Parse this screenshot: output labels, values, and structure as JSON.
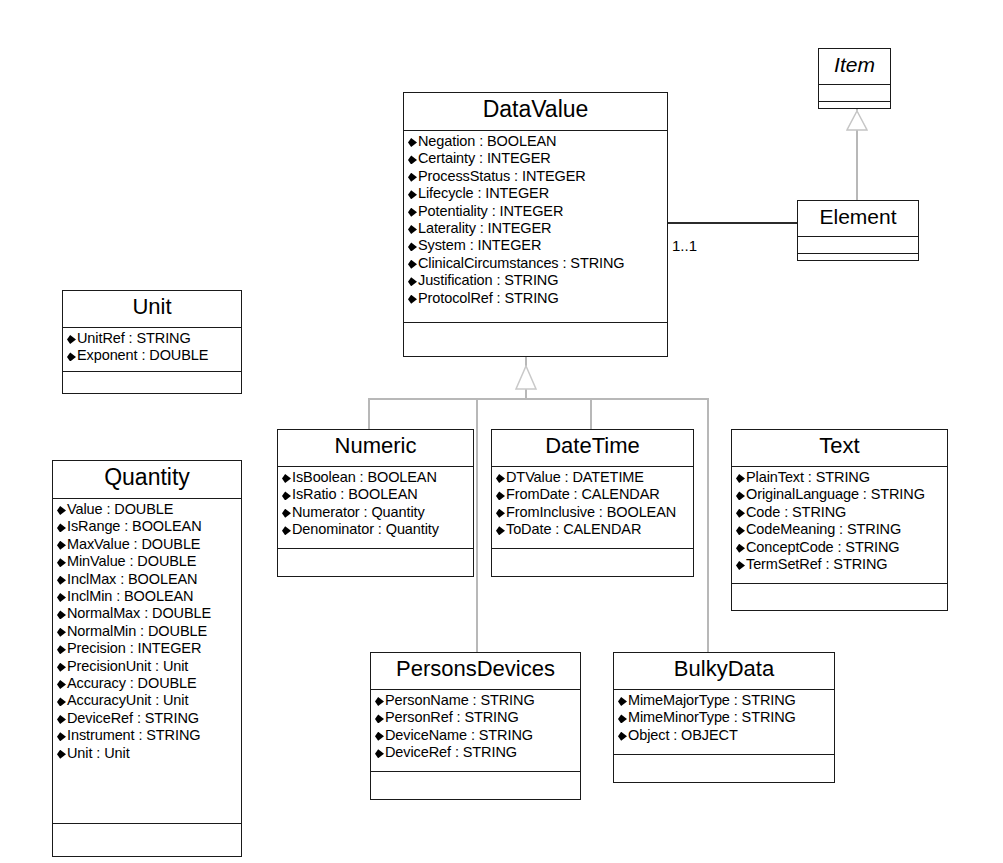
{
  "diagram": {
    "type": "uml-class-diagram",
    "background": "#ffffff",
    "line_color": "#6e6e6e",
    "border_color": "#1a1a1a"
  },
  "classes": {
    "item": {
      "name": "Item",
      "abstract": true,
      "attributes": [],
      "operations": []
    },
    "element": {
      "name": "Element",
      "abstract": false,
      "attributes": [],
      "operations": []
    },
    "datavalue": {
      "name": "DataValue",
      "abstract": false,
      "attributes": [
        "Negation : BOOLEAN",
        "Certainty : INTEGER",
        "ProcessStatus : INTEGER",
        "Lifecycle : INTEGER",
        "Potentiality : INTEGER",
        "Laterality : INTEGER",
        "System : INTEGER",
        "ClinicalCircumstances : STRING",
        "Justification : STRING",
        "ProtocolRef : STRING"
      ],
      "operations": []
    },
    "unit": {
      "name": "Unit",
      "abstract": false,
      "attributes": [
        "UnitRef : STRING",
        "Exponent : DOUBLE"
      ],
      "operations": []
    },
    "quantity": {
      "name": "Quantity",
      "abstract": false,
      "attributes": [
        "Value : DOUBLE",
        "IsRange : BOOLEAN",
        "MaxValue : DOUBLE",
        "MinValue : DOUBLE",
        "InclMax : BOOLEAN",
        "InclMin : BOOLEAN",
        "NormalMax : DOUBLE",
        "NormalMin : DOUBLE",
        "Precision : INTEGER",
        "PrecisionUnit : Unit",
        "Accuracy : DOUBLE",
        "AccuracyUnit : Unit",
        "DeviceRef : STRING",
        "Instrument : STRING",
        "Unit : Unit"
      ],
      "operations": []
    },
    "numeric": {
      "name": "Numeric",
      "abstract": false,
      "attributes": [
        "IsBoolean : BOOLEAN",
        "IsRatio : BOOLEAN",
        "Numerator : Quantity",
        "Denominator : Quantity"
      ],
      "operations": []
    },
    "datetime": {
      "name": "DateTime",
      "abstract": false,
      "attributes": [
        "DTValue : DATETIME",
        "FromDate : CALENDAR",
        "FromInclusive : BOOLEAN",
        "ToDate : CALENDAR"
      ],
      "operations": []
    },
    "text": {
      "name": "Text",
      "abstract": false,
      "attributes": [
        "PlainText : STRING",
        "OriginalLanguage : STRING",
        "Code : STRING",
        "CodeMeaning : STRING",
        "ConceptCode : STRING",
        "TermSetRef : STRING"
      ],
      "operations": []
    },
    "personsdevices": {
      "name": "PersonsDevices",
      "abstract": false,
      "attributes": [
        "PersonName : STRING",
        "PersonRef : STRING",
        "DeviceName : STRING",
        "DeviceRef : STRING"
      ],
      "operations": []
    },
    "bulkydata": {
      "name": "BulkyData",
      "abstract": false,
      "attributes": [
        "MimeMajorType : STRING",
        "MimeMinorType : STRING",
        "Object : OBJECT"
      ],
      "operations": []
    }
  },
  "relationships": {
    "element_to_item": {
      "kind": "generalization",
      "from": "Element",
      "to": "Item",
      "label": ""
    },
    "datavalue_to_element": {
      "kind": "association",
      "from": "DataValue",
      "to": "Element",
      "label": "1..1"
    },
    "subclasses_of_datavalue": {
      "kind": "generalization",
      "to": "DataValue",
      "from": [
        "Numeric",
        "DateTime",
        "Text",
        "PersonsDevices",
        "BulkyData"
      ],
      "label": ""
    }
  }
}
